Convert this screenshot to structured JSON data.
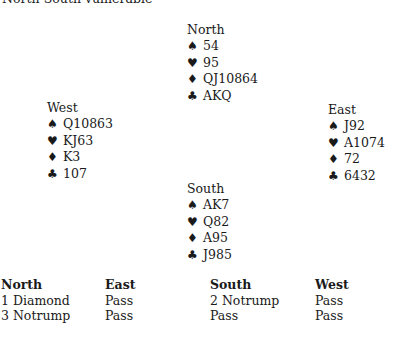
{
  "vulnerability": "North-South vulnerable",
  "suits": {
    "spades": "♠",
    "hearts": "♥",
    "diamonds": "♦",
    "clubs": "♣"
  },
  "hands": {
    "north": {
      "seat": "North",
      "spades": "54",
      "hearts": "95",
      "diamonds": "QJ10864",
      "clubs": "AKQ"
    },
    "west": {
      "seat": "West",
      "spades": "Q10863",
      "hearts": "KJ63",
      "diamonds": "K3",
      "clubs": "107"
    },
    "east": {
      "seat": "East",
      "spades": "J92",
      "hearts": "A1074",
      "diamonds": "72",
      "clubs": "6432"
    },
    "south": {
      "seat": "South",
      "spades": "AK7",
      "hearts": "Q82",
      "diamonds": "A95",
      "clubs": "J985"
    }
  },
  "auction": {
    "columns": [
      {
        "header": "North",
        "bids": [
          "1 Diamond",
          "3 Notrump"
        ]
      },
      {
        "header": "East",
        "bids": [
          "Pass",
          "Pass"
        ]
      },
      {
        "header": "South",
        "bids": [
          "2 Notrump",
          "Pass"
        ]
      },
      {
        "header": "West",
        "bids": [
          "Pass",
          "Pass"
        ]
      }
    ]
  }
}
